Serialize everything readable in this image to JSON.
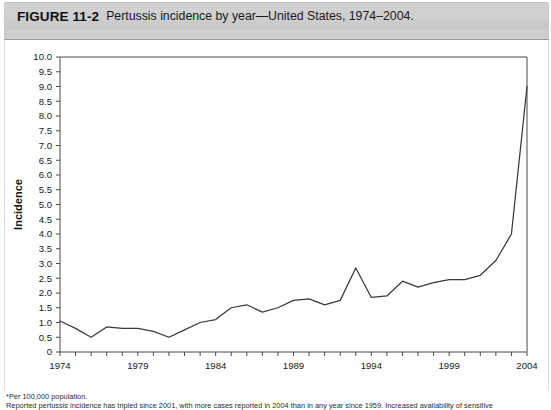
{
  "figure": {
    "label": "FIGURE 11-2",
    "caption": "Pertussis incidence by year—United States, 1974–2004."
  },
  "footnotes": [
    "*Per 100,000 population.",
    "Reported pertussis incidence has tripled since 2001, with more cases reported in 2004 than in any year since 1959. Increased availability of sensitive"
  ],
  "colors": {
    "title_band": "#cfcfcf",
    "line": "#3a3a3a",
    "axis": "#4a4a4a",
    "plot_background": "#ffffff"
  },
  "chart_data": {
    "type": "line",
    "title": "Pertussis incidence by year—United States, 1974–2004",
    "xlabel": "Year",
    "ylabel": "Incidence",
    "xlim": [
      1974,
      2004
    ],
    "ylim": [
      0,
      10
    ],
    "grid": false,
    "legend": null,
    "x_tick_labels": [
      "1974",
      "1979",
      "1984",
      "1989",
      "1994",
      "1999",
      "2004"
    ],
    "x_tick_values": [
      1974,
      1979,
      1984,
      1989,
      1994,
      1999,
      2004
    ],
    "y_tick_labels": [
      "0",
      "0.5",
      "1.0",
      "1.5",
      "2.0",
      "2.5",
      "3.0",
      "3.5",
      "4.0",
      "4.5",
      "5.0",
      "5.5",
      "6.0",
      "6.5",
      "7.0",
      "7.5",
      "8.0",
      "8.5",
      "9.0",
      "9.5",
      "10.0"
    ],
    "y_tick_values": [
      0,
      0.5,
      1.0,
      1.5,
      2.0,
      2.5,
      3.0,
      3.5,
      4.0,
      4.5,
      5.0,
      5.5,
      6.0,
      6.5,
      7.0,
      7.5,
      8.0,
      8.5,
      9.0,
      9.5,
      10.0
    ],
    "x": [
      1974,
      1975,
      1976,
      1977,
      1978,
      1979,
      1980,
      1981,
      1982,
      1983,
      1984,
      1985,
      1986,
      1987,
      1988,
      1989,
      1990,
      1991,
      1992,
      1993,
      1994,
      1995,
      1996,
      1997,
      1998,
      1999,
      2000,
      2001,
      2002,
      2003,
      2004
    ],
    "series": [
      {
        "name": "Pertussis incidence",
        "values": [
          1.05,
          0.8,
          0.5,
          0.85,
          0.8,
          0.8,
          0.7,
          0.5,
          0.75,
          1.0,
          1.1,
          1.5,
          1.6,
          1.35,
          1.5,
          1.75,
          1.8,
          1.6,
          1.75,
          2.85,
          1.85,
          1.9,
          2.4,
          2.2,
          2.35,
          2.45,
          2.45,
          2.6,
          3.1,
          4.0,
          9.0
        ]
      }
    ]
  }
}
